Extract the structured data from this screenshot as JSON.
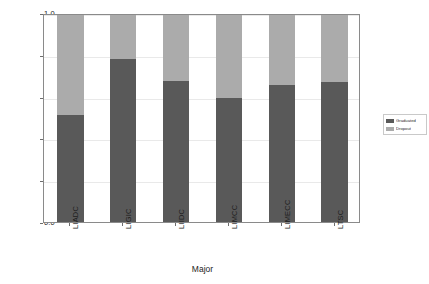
{
  "chart_data": {
    "type": "bar",
    "subtype": "stacked-bar-proportion",
    "title": "",
    "xlabel": "Major",
    "ylabel": "Proportion",
    "categories": [
      "LIADC",
      "LIGIC",
      "LIIDC",
      "LIMCC",
      "LIMECC",
      "LTSC"
    ],
    "series": [
      {
        "name": "Graduated",
        "color": "#595959",
        "values": [
          0.51,
          0.78,
          0.675,
          0.595,
          0.655,
          0.67
        ]
      },
      {
        "name": "Dropout",
        "color": "#ababab",
        "values": [
          0.49,
          0.22,
          0.325,
          0.405,
          0.345,
          0.33
        ]
      }
    ],
    "ylim": [
      0.0,
      1.0
    ],
    "ytick_labels": [
      "0.0",
      "0.2",
      "0.4",
      "0.6",
      "0.8",
      "1.0"
    ],
    "ytick_values": [
      0.0,
      0.2,
      0.4,
      0.6,
      0.8,
      1.0
    ],
    "grid": true,
    "grid_axis": "y",
    "legend_position": "right",
    "legend_entries": [
      "Graduated",
      "Dropout"
    ]
  },
  "axes": {
    "y_title": "Proportion",
    "x_title": "Major"
  },
  "legend": {
    "items": [
      {
        "label": "Graduated",
        "color": "#595959"
      },
      {
        "label": "Dropout",
        "color": "#ababab"
      }
    ]
  },
  "colors": {
    "graduated": "#595959",
    "dropout": "#ababab",
    "frame": "#8a8a8a",
    "grid": "#e9e9e9",
    "background": "#ffffff"
  }
}
